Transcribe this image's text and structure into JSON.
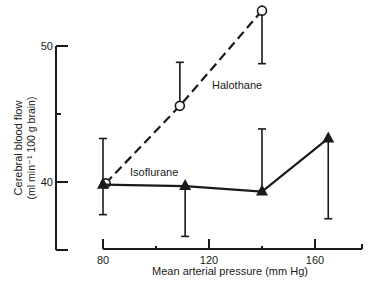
{
  "chart_data": {
    "type": "line",
    "title": "",
    "xlabel": "Mean arterial pressure  (mm Hg)",
    "ylabel_line1": "Cerebral blood flow",
    "ylabel_line2": "(ml min⁻¹  100 g brain)",
    "xlim": [
      80,
      178
    ],
    "ylim": [
      35,
      50
    ],
    "x_ticks": [
      80,
      120,
      160
    ],
    "x_minor_ticks": [
      100,
      140
    ],
    "y_ticks": [
      40,
      50
    ],
    "y_minor_ticks": [
      45
    ],
    "grid": false,
    "legend_position": "inline labels",
    "series": [
      {
        "name": "Halothane",
        "marker": "open-circle",
        "line_style": "dashed",
        "x": [
          81,
          109,
          140
        ],
        "y": [
          39.9,
          45.6,
          52.6
        ],
        "error_bars": [
          {
            "direction": "none",
            "end": null
          },
          {
            "direction": "up",
            "end": 48.8
          },
          {
            "direction": "down",
            "end": 48.7
          }
        ],
        "label_pos": {
          "x": 212,
          "y": 89
        }
      },
      {
        "name": "Isoflurane",
        "marker": "filled-triangle",
        "line_style": "solid",
        "x": [
          80,
          111,
          140,
          165
        ],
        "y": [
          39.8,
          39.7,
          39.3,
          43.2
        ],
        "error_bars": [
          {
            "direction": "both",
            "end_up": 43.2,
            "end_down": 37.6
          },
          {
            "direction": "down",
            "end": 36.0
          },
          {
            "direction": "up",
            "end": 43.9
          },
          {
            "direction": "down",
            "end": 37.3
          }
        ],
        "label_pos": {
          "x": 130,
          "y": 176
        }
      }
    ]
  }
}
